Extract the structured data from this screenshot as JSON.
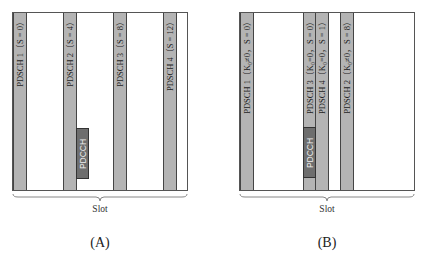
{
  "panels": [
    {
      "id": "A",
      "caption": "(A)",
      "slot_label": "Slot",
      "bars": [
        {
          "label": "PDSCH 1（S = 0）"
        },
        {
          "label": "PDSCH 2（S = 4）"
        },
        {
          "label": "PDSCH 3（S = 8）"
        },
        {
          "label": "PDSCH 4（S = 12）"
        }
      ],
      "pdcch_label": "PDCCH"
    },
    {
      "id": "B",
      "caption": "(B)",
      "slot_label": "Slot",
      "bars": [
        {
          "label": "PDSCH 1（K₀≠0，S = 0）"
        },
        {
          "label": "PDSCH 3（K₀=0，S = 0）"
        },
        {
          "label": "PDSCH 4（K₀=0，S = 1）"
        },
        {
          "label": "PDSCH 2（K₀≠0，S = 8）"
        }
      ],
      "pdcch_label": "PDCCH"
    }
  ],
  "colors": {
    "pdsch_fill": "#b4b4b4",
    "pdcch_fill": "#6e6e6e",
    "border": "#444444"
  }
}
